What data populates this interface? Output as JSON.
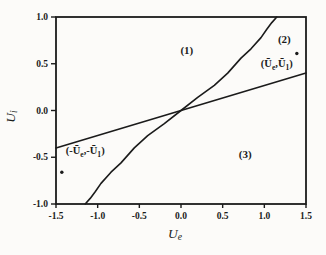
{
  "figure": {
    "background": "#fcfbf9",
    "ink": "#1b1b1b"
  },
  "chart_data": {
    "type": "line",
    "title": "",
    "xlabel_parts": [
      [
        "U",
        0
      ],
      [
        "e",
        1
      ]
    ],
    "ylabel_parts": [
      [
        "U",
        0
      ],
      [
        "i",
        1
      ]
    ],
    "xlim": [
      -1.5,
      1.5
    ],
    "ylim": [
      -1.0,
      1.0
    ],
    "grid": false,
    "legend": "none",
    "x_ticks": [
      -1.5,
      -1.0,
      -0.5,
      0.0,
      0.5,
      1.0,
      1.5
    ],
    "x_tick_labels": [
      "-1.5",
      "-1.0",
      "-0.5",
      "0.0",
      "0.5",
      "1.0",
      "1.5"
    ],
    "y_ticks": [
      1.0,
      0.5,
      0.0,
      -0.5,
      -1.0
    ],
    "y_tick_labels": [
      "1.0",
      "0.5",
      "0.0",
      "-0.5",
      "-1.0"
    ],
    "series": [
      {
        "name": "sigmoid-boundary-curve",
        "points": [
          [
            -1.15,
            -1.0
          ],
          [
            -1.09,
            -0.94
          ],
          [
            -1.03,
            -0.87
          ],
          [
            -0.96,
            -0.78
          ],
          [
            -0.84,
            -0.66
          ],
          [
            -0.72,
            -0.56
          ],
          [
            -0.56,
            -0.4
          ],
          [
            -0.4,
            -0.27
          ],
          [
            -0.2,
            -0.14
          ],
          [
            0,
            0
          ],
          [
            0.2,
            0.14
          ],
          [
            0.4,
            0.27
          ],
          [
            0.56,
            0.4
          ],
          [
            0.72,
            0.56
          ],
          [
            0.84,
            0.66
          ],
          [
            0.96,
            0.78
          ],
          [
            1.03,
            0.87
          ],
          [
            1.09,
            0.94
          ],
          [
            1.15,
            1.0
          ]
        ]
      },
      {
        "name": "linear-boundary-line",
        "points": [
          [
            -1.5,
            -0.4
          ],
          [
            1.5,
            0.4
          ]
        ]
      }
    ],
    "region_labels": [
      {
        "text": "(1)",
        "x": 0.07,
        "y": 0.64
      },
      {
        "text": "(2)",
        "x": 1.24,
        "y": 0.76
      },
      {
        "text": "(3)",
        "x": 0.77,
        "y": -0.47
      }
    ],
    "point_annotations": [
      {
        "name": "equilibrium-point-positive",
        "parts": [
          [
            "(",
            0
          ],
          [
            "Ū",
            0
          ],
          [
            "e",
            1
          ],
          [
            ",",
            0
          ],
          [
            "Ū",
            0
          ],
          [
            "1",
            1
          ],
          [
            ")",
            0
          ]
        ],
        "x": 1.15,
        "y": 0.5,
        "dot_x": 1.39,
        "dot_y": 0.61
      },
      {
        "name": "equilibrium-point-negative",
        "parts": [
          [
            "(-",
            0
          ],
          [
            "Ū",
            0
          ],
          [
            "e",
            1
          ],
          [
            ",-",
            0
          ],
          [
            "Ū",
            0
          ],
          [
            "1",
            1
          ],
          [
            ")",
            0
          ]
        ],
        "x": -1.15,
        "y": -0.43,
        "dot_x": -1.43,
        "dot_y": -0.66
      }
    ]
  }
}
